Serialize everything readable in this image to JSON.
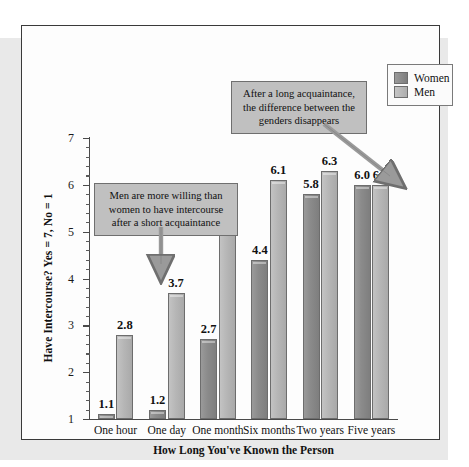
{
  "figure": {
    "frame_border_color": "#3a3a3a",
    "background": "#fdfdfd"
  },
  "legend": {
    "position": "top-right",
    "items": [
      {
        "label": "Women",
        "swatch": "women-swatch",
        "color": "#8b8b8b"
      },
      {
        "label": "Men",
        "swatch": "men-swatch",
        "color": "#b6b6b6"
      }
    ]
  },
  "annotations": [
    {
      "id": "callout-long",
      "text": "After a long acquaintance, the difference between the genders disappears",
      "arrow": "diagonal-arrow-down-right",
      "points_to": "Five years"
    },
    {
      "id": "callout-short",
      "text": "Men are more willing than women to have intercourse after a short acquaintance",
      "arrow": "vertical-arrow-down",
      "points_to": "One day"
    }
  ],
  "chart_data": {
    "type": "bar",
    "title": "",
    "xlabel": "How Long You've Known the Person",
    "ylabel": "Have Intercourse? Yes = 7, No = 1",
    "categories": [
      "One hour",
      "One day",
      "One month",
      "Six months",
      "Two years",
      "Five years"
    ],
    "series": [
      {
        "name": "Women",
        "color": "#8b8b8b",
        "values": [
          1.1,
          1.2,
          2.7,
          4.4,
          5.8,
          6.0
        ]
      },
      {
        "name": "Men",
        "color": "#b6b6b6",
        "values": [
          2.8,
          3.7,
          5.0,
          6.1,
          6.3,
          6.0
        ]
      }
    ],
    "value_labels": [
      [
        "1.1",
        "2.8"
      ],
      [
        "1.2",
        "3.7"
      ],
      [
        "2.7",
        "5.0"
      ],
      [
        "4.4",
        "6.1"
      ],
      [
        "5.8",
        "6.3"
      ],
      [
        "6.0",
        "6.0"
      ]
    ],
    "ylim": [
      1,
      7
    ],
    "ytick_labels": [
      "1",
      "2",
      "3",
      "4",
      "5",
      "6",
      "7"
    ],
    "yticks": [
      1,
      2,
      3,
      4,
      5,
      6,
      7
    ],
    "yminor_step": 0.2,
    "grid": false,
    "legend_position": "top-right"
  }
}
